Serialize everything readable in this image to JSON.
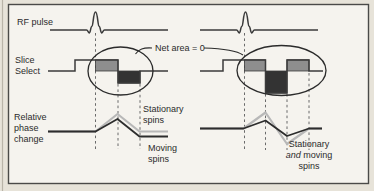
{
  "diagram": {
    "rows": {
      "rf": "RF pulse",
      "slice": [
        "Slice",
        "Select"
      ],
      "phase": [
        "Relative",
        "phase",
        "change"
      ]
    },
    "annotations": {
      "net_area": "Net area = 0",
      "left_stationary": [
        "Stationary",
        "spins"
      ],
      "left_moving": [
        "Moving",
        "spins"
      ],
      "right_both": {
        "line1": "Stationary",
        "line2_italic": "and",
        "line2_rest": " moving",
        "line3": "spins"
      }
    },
    "colors": {
      "background_outer": "#e7e3d9",
      "background_inner": "#f5f3ee",
      "frame_border": "#4a4a48",
      "positive_lobe_fill": "#8e8e8e",
      "negative_lobe_fill": "#333333",
      "waveform_line": "#3b3b3b",
      "stationary_curve": "#b8b8b8",
      "moving_curve": "#2d2d2d",
      "dashed_line": "#5a5a5a"
    }
  }
}
